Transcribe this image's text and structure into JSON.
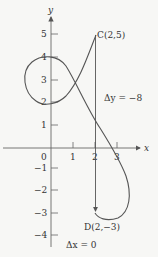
{
  "axes": {
    "x_label": "x",
    "y_label": "y",
    "origin_label": "0",
    "x_ticks": [
      "1",
      "2",
      "3"
    ],
    "y_ticks": [
      "5",
      "4",
      "3",
      "2",
      "1",
      "−1",
      "−2",
      "−3",
      "−4"
    ]
  },
  "points": {
    "C": {
      "label": "C(2,5)",
      "x": 2,
      "y": 5
    },
    "D": {
      "label": "D(2,−3)",
      "x": 2,
      "y": -3
    }
  },
  "annotations": {
    "delta_y": "Δy  =  −8",
    "delta_x": "Δx  =  0"
  },
  "colors": {
    "curve": "#555555",
    "axis": "#555555",
    "text": "#333333",
    "background": "#f7f7f5"
  }
}
